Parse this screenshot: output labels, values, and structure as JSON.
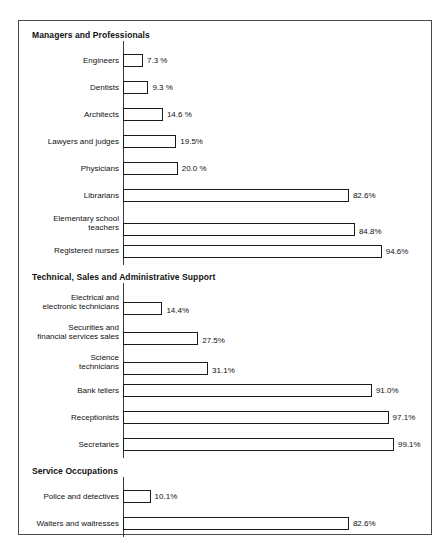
{
  "chart_data": {
    "type": "bar",
    "orientation": "horizontal",
    "title": "",
    "xlabel": "",
    "ylabel": "",
    "xlim": [
      0,
      100
    ],
    "grid": false,
    "legend": null,
    "value_suffix": "%",
    "axis_baseline_percent": 0,
    "groups": [
      {
        "heading": "Managers and Professionals",
        "categories": [
          "Engineers",
          "Dentists",
          "Architects",
          "Lawyers and judges",
          "Physicians",
          "Librarians",
          "Elementary school\nteachers",
          "Registered nurses"
        ],
        "values": [
          7.3,
          9.3,
          14.6,
          19.5,
          20.0,
          82.6,
          84.8,
          94.6
        ],
        "value_labels": [
          "7.3 %",
          "9.3 %",
          "14.6 %",
          "19.5%",
          "20.0 %",
          "82.6%",
          "84.8%",
          "94.6%"
        ]
      },
      {
        "heading": "Technical, Sales and Administrative Support",
        "categories": [
          "Electrical and\nelectronic technicians",
          "Securities and\nfinancial services sales",
          "Science\ntechnicians",
          "Bank tellers",
          "Receptionists",
          "Secretaries"
        ],
        "values": [
          14.4,
          27.5,
          31.1,
          91.0,
          97.1,
          99.1
        ],
        "value_labels": [
          "14.4%",
          "27.5%",
          "31.1%",
          "91.0%",
          "97.1%",
          "99.1%"
        ]
      },
      {
        "heading": "Service Occupations",
        "categories": [
          "Police and detectives",
          "Waiters and  waitresses"
        ],
        "values": [
          10.1,
          82.6
        ],
        "value_labels": [
          "10.1%",
          "82.6%"
        ]
      }
    ]
  },
  "style": {
    "bar_fill": "#ffffff",
    "bar_stroke": "#1a1a1a",
    "frame_stroke": "#4a4a4a",
    "text_color": "#111111",
    "page_background": "#ffffff"
  }
}
